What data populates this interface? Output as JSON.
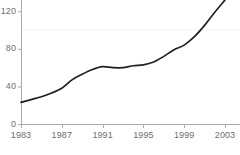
{
  "chart_data": {
    "type": "line",
    "title": "",
    "subtitle": "",
    "xlabel": "",
    "ylabel": "",
    "xlim": [
      1983,
      2003
    ],
    "ylim": [
      0,
      132
    ],
    "grid": true,
    "gridlines_y": [
      100
    ],
    "legend": null,
    "legend_position": "none",
    "x_tick_labels": [
      "1983",
      "1987",
      "1991",
      "1995",
      "1999",
      "2003"
    ],
    "x_tick_values": [
      1983,
      1987,
      1991,
      1995,
      1999,
      2003
    ],
    "y_tick_labels": [
      "0",
      "40",
      "80",
      "120"
    ],
    "y_tick_values": [
      0,
      40,
      80,
      120
    ],
    "series": [
      {
        "name": "series-1",
        "color": "#231f20",
        "x": [
          1983,
          1984,
          1985,
          1986,
          1987,
          1988,
          1989,
          1990,
          1991,
          1992,
          1993,
          1994,
          1995,
          1996,
          1997,
          1998,
          1999,
          2000,
          2001,
          2002,
          2003
        ],
        "values": [
          23,
          26,
          29,
          33,
          38,
          47,
          53,
          58,
          61,
          60,
          60,
          62,
          63,
          66,
          72,
          79,
          84,
          93,
          105,
          119,
          132
        ]
      }
    ]
  },
  "axes": {
    "axis_color": "#a7a9ac",
    "gridline_color": "#f2f2f2",
    "tick_color": "#a7a9ac",
    "label_color": "#6d6e70",
    "background": "#ffffff"
  },
  "geometry": {
    "plot_left": 21,
    "plot_right": 225,
    "plot_bottom": 124,
    "value_top": 132,
    "value_top_y": 0
  }
}
